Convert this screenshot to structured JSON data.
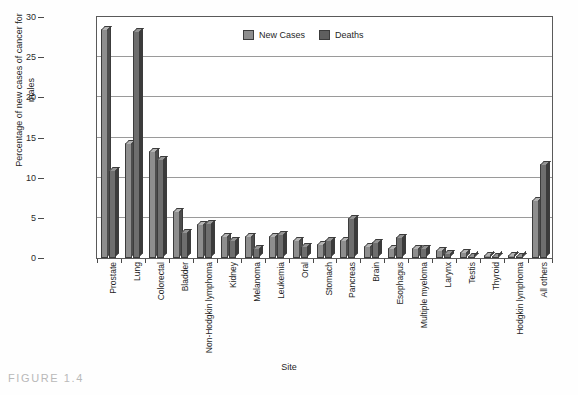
{
  "caption": "FIGURE 1.4",
  "legend": {
    "position": "top-center",
    "items": [
      {
        "label": "New Cases",
        "color": "#8e8e8e"
      },
      {
        "label": "Deaths",
        "color": "#5f5f5f"
      }
    ]
  },
  "chart_data": {
    "type": "bar",
    "title": "",
    "xlabel": "Site",
    "ylabel": "Percentage of new cases of cancer for males",
    "ylim": [
      0,
      30
    ],
    "yticks": [
      0,
      5,
      10,
      15,
      20,
      25,
      30
    ],
    "grid": true,
    "categories": [
      "Prostate",
      "Lung",
      "Colorectal",
      "Bladder",
      "Non-Hodgkin lymphoma",
      "Kidney",
      "Melanoma",
      "Leukemia",
      "Oral",
      "Stomach",
      "Pancreas",
      "Brain",
      "Esophagus",
      "Multiple myeloma",
      "Larynx",
      "Testis",
      "Thyroid",
      "Hodgkin lymphoma",
      "All others"
    ],
    "series": [
      {
        "name": "New Cases",
        "color": "#8e8e8e",
        "values": [
          28.5,
          14.3,
          13.3,
          5.8,
          4.2,
          2.7,
          2.7,
          2.7,
          2.2,
          1.7,
          2.2,
          1.5,
          1.2,
          1.2,
          1.0,
          0.7,
          0.4,
          0.4,
          7.2
        ]
      },
      {
        "name": "Deaths",
        "color": "#5f5f5f",
        "values": [
          11.0,
          28.3,
          12.3,
          3.2,
          4.3,
          2.3,
          1.3,
          3.0,
          1.5,
          2.2,
          5.0,
          2.0,
          2.6,
          1.3,
          0.6,
          0.2,
          0.3,
          0.2,
          11.7
        ]
      }
    ]
  }
}
